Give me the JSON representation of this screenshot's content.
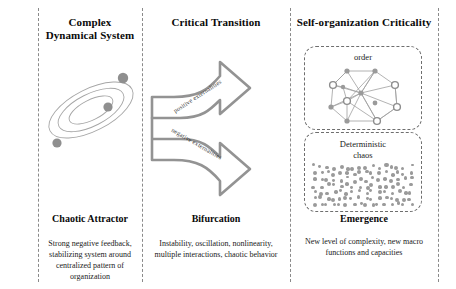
{
  "columns": [
    {
      "id": "complex-dynamical-system",
      "header": "Complex\nDynamical System",
      "header_line1": "Complex",
      "header_line2": "Dynamical System",
      "caption_title": "Chaotic Attractor",
      "caption_body": "Strong negative feedback, stabilizing system around centralized pattern of organization",
      "figure": "chaotic-attractor-ellipses"
    },
    {
      "id": "critical-transition",
      "header": "Critical Transition",
      "header_line1": "Critical Transition",
      "header_line2": "",
      "caption_title": "Bifurcation",
      "caption_body": "Instability, oscillation, nonlinearity, multiple interactions, chaotic behavior",
      "figure": "split-arrows"
    },
    {
      "id": "self-organization-criticality",
      "header": "Self-organization Criticality",
      "header_line1": "Self-organization Criticality",
      "header_line2": "",
      "caption_title": "Emergence",
      "caption_body": "New level of complexity, new macro functions and capacities",
      "figure": "order-network-and-chaos"
    }
  ],
  "arrows": {
    "upper_label": "positive externalities",
    "lower_label": "negative externalities"
  },
  "right_panel": {
    "order_box_label": "order",
    "chaos_box_label_line1": "Deterministic",
    "chaos_box_label_line2": "chaos"
  },
  "colors": {
    "divider": "#8a8a8a",
    "stroke": "#9a9a9a",
    "arrow_stroke": "#8f8f8f",
    "node_fill": "#9a9a9a",
    "text": "#0a0a0a",
    "background": "#ffffff"
  }
}
